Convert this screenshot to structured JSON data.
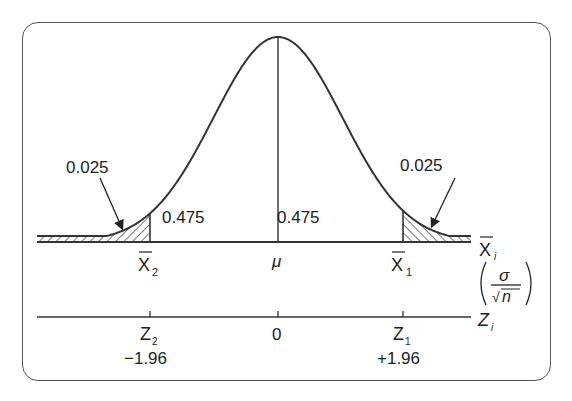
{
  "diagram": {
    "type": "normal-distribution-confidence-interval",
    "tail_areas": {
      "left": "0.025",
      "right": "0.025"
    },
    "center_areas": {
      "left": "0.475",
      "right": "0.475"
    },
    "xbar_axis": {
      "label_main": "X",
      "label_sub": "i",
      "ticks": [
        {
          "main": "X",
          "sub": "2",
          "bar": true
        },
        {
          "main": "μ",
          "sub": "",
          "bar": false
        },
        {
          "main": "X",
          "sub": "1",
          "bar": true
        }
      ]
    },
    "scale_factor": {
      "numerator": "σ",
      "denominator": "n",
      "radical": "√"
    },
    "z_axis": {
      "label_main": "Z",
      "label_sub": "i",
      "ticks": [
        {
          "main": "Z",
          "sub": "2",
          "value": "−1.96"
        },
        {
          "main": "0",
          "sub": "",
          "value": ""
        },
        {
          "main": "Z",
          "sub": "1",
          "value": "+1.96"
        }
      ]
    },
    "colors": {
      "line": "#333333",
      "frame": "#555555",
      "hatch": "#333333",
      "background": "#ffffff"
    }
  }
}
